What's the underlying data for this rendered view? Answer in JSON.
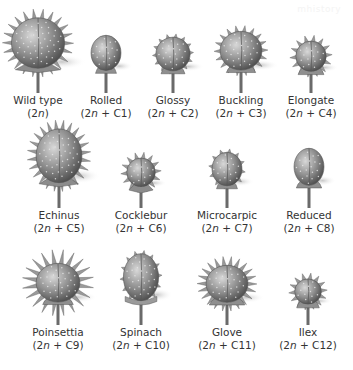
{
  "figure": {
    "watermark": "mhistory",
    "rows": [
      {
        "items": [
          {
            "name": "Wild type",
            "karyotype_prefix": "(2",
            "karyotype_n": "n",
            "karyotype_suffix": ")",
            "cx": 38,
            "label_y": 94,
            "w": 56,
            "h": 60,
            "spikes": "long",
            "spike_count": 22,
            "base": "star",
            "shape": "round"
          },
          {
            "name": "Rolled",
            "karyotype_prefix": "(2",
            "karyotype_n": "n",
            "karyotype_suffix": " + C1)",
            "cx": 106,
            "label_y": 94,
            "w": 34,
            "h": 42,
            "spikes": "dots",
            "spike_count": 0,
            "base": "cup",
            "shape": "oval"
          },
          {
            "name": "Glossy",
            "karyotype_prefix": "(2",
            "karyotype_n": "n",
            "karyotype_suffix": " + C2)",
            "cx": 173,
            "label_y": 94,
            "w": 36,
            "h": 40,
            "spikes": "short",
            "spike_count": 14,
            "base": "cup",
            "shape": "round"
          },
          {
            "name": "Buckling",
            "karyotype_prefix": "(2",
            "karyotype_n": "n",
            "karyotype_suffix": " + C3)",
            "cx": 241,
            "label_y": 94,
            "w": 44,
            "h": 46,
            "spikes": "medium",
            "spike_count": 18,
            "base": "cup",
            "shape": "round"
          },
          {
            "name": "Elongate",
            "karyotype_prefix": "(2",
            "karyotype_n": "n",
            "karyotype_suffix": " + C4)",
            "cx": 311,
            "label_y": 94,
            "w": 32,
            "h": 36,
            "spikes": "medium",
            "spike_count": 14,
            "base": "bell",
            "shape": "round"
          }
        ]
      },
      {
        "items": [
          {
            "name": "Echinus",
            "karyotype_prefix": "(2",
            "karyotype_n": "n",
            "karyotype_suffix": " + C5)",
            "cx": 59,
            "label_y": 209,
            "w": 52,
            "h": 64,
            "spikes": "long",
            "spike_count": 24,
            "base": "star",
            "shape": "oval"
          },
          {
            "name": "Cocklebur",
            "karyotype_prefix": "(2",
            "karyotype_n": "n",
            "karyotype_suffix": " + C6)",
            "cx": 141,
            "label_y": 209,
            "w": 30,
            "h": 34,
            "spikes": "medium",
            "spike_count": 14,
            "base": "star",
            "shape": "round"
          },
          {
            "name": "Microcarpic",
            "karyotype_prefix": "(2",
            "karyotype_n": "n",
            "karyotype_suffix": " + C7)",
            "cx": 227,
            "label_y": 209,
            "w": 34,
            "h": 40,
            "spikes": "short",
            "spike_count": 12,
            "base": "cup",
            "shape": "oval"
          },
          {
            "name": "Reduced",
            "karyotype_prefix": "(2",
            "karyotype_n": "n",
            "karyotype_suffix": " + C8)",
            "cx": 309,
            "label_y": 209,
            "w": 34,
            "h": 44,
            "spikes": "dots",
            "spike_count": 0,
            "base": "bell",
            "shape": "oval"
          }
        ]
      },
      {
        "items": [
          {
            "name": "Poinsettia",
            "karyotype_prefix": "(2",
            "karyotype_n": "n",
            "karyotype_suffix": " + C9)",
            "cx": 58,
            "label_y": 326,
            "w": 46,
            "h": 46,
            "spikes": "star",
            "spike_count": 20,
            "base": "cup",
            "shape": "round"
          },
          {
            "name": "Spinach",
            "karyotype_prefix": "(2",
            "karyotype_n": "n",
            "karyotype_suffix": " + C10)",
            "cx": 141,
            "label_y": 326,
            "w": 40,
            "h": 56,
            "spikes": "short",
            "spike_count": 14,
            "base": "ribbon",
            "shape": "oval"
          },
          {
            "name": "Glove",
            "karyotype_prefix": "(2",
            "karyotype_n": "n",
            "karyotype_suffix": " + C11)",
            "cx": 227,
            "label_y": 326,
            "w": 44,
            "h": 44,
            "spikes": "long",
            "spike_count": 22,
            "base": "bell",
            "shape": "round"
          },
          {
            "name": "Ilex",
            "karyotype_prefix": "(2",
            "karyotype_n": "n",
            "karyotype_suffix": " + C12)",
            "cx": 308,
            "label_y": 326,
            "w": 28,
            "h": 30,
            "spikes": "medium",
            "spike_count": 14,
            "base": "bell",
            "shape": "round"
          }
        ]
      }
    ]
  }
}
